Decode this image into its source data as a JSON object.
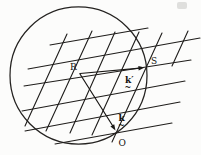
{
  "figure": {
    "kind": "ewald-sphere-lattice-construction",
    "labels": {
      "sphere_center": "R",
      "lattice_point": "S",
      "origin_point": "O",
      "k_vector": "k",
      "k_vector_tilde": "~",
      "k_prime_vector": "k′",
      "k_prime_tilde": "~"
    },
    "colors": {
      "ink": "#1f1d1b",
      "paper": "#fcfcfb"
    }
  }
}
